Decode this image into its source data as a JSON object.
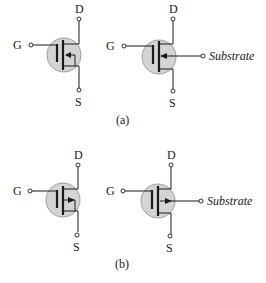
{
  "figure": {
    "panels": [
      {
        "id": "a",
        "label": "(a)",
        "symbols": [
          {
            "type": "enhancement MOSFET (3-terminal, substrate tied to source)",
            "terminals": {
              "gate": "G",
              "drain": "D",
              "source": "S"
            }
          },
          {
            "type": "enhancement MOSFET (4-terminal)",
            "terminals": {
              "gate": "G",
              "drain": "D",
              "source": "S",
              "substrate": "Substrate"
            }
          }
        ]
      },
      {
        "id": "b",
        "label": "(b)",
        "symbols": [
          {
            "type": "enhancement MOSFET (3-terminal, substrate tied to source)",
            "terminals": {
              "gate": "G",
              "drain": "D",
              "source": "S"
            }
          },
          {
            "type": "enhancement MOSFET (4-terminal)",
            "terminals": {
              "gate": "G",
              "drain": "D",
              "source": "S",
              "substrate": "Substrate"
            }
          }
        ]
      }
    ],
    "terminal_labels": {
      "gate": "G",
      "drain": "D",
      "source": "S",
      "substrate": "Substrate"
    },
    "colors": {
      "line": "#1a1a1a",
      "body_fill": "#d4d4d4",
      "body_outline": "#8a8a8a",
      "background": "#ffffff"
    }
  }
}
